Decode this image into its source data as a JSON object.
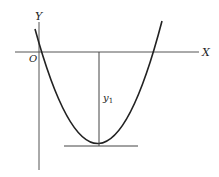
{
  "diagram": {
    "type": "parabola-with-axes",
    "axes": {
      "x_label": "X",
      "y_label": "Y",
      "origin_label": "O"
    },
    "annotations": {
      "vertical_segment_label": "y",
      "vertical_segment_subscript": "1"
    },
    "colors": {
      "stroke": "#222222",
      "axis": "#555555",
      "background": "#ffffff"
    }
  }
}
